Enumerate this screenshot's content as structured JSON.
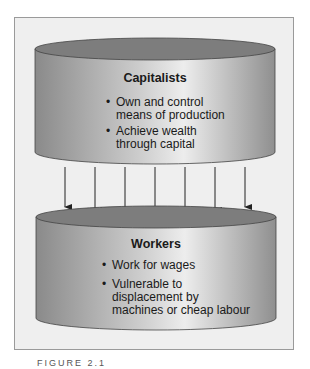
{
  "diagram": {
    "top_cylinder": {
      "title": "Capitalists",
      "bullets": [
        "Own and control means of production",
        "Achieve wealth through capital"
      ],
      "bullet_lines": [
        [
          "Own and control",
          "means of production"
        ],
        [
          "Achieve wealth",
          "through capital"
        ]
      ]
    },
    "bottom_cylinder": {
      "title": "Workers",
      "bullets": [
        "Work for wages",
        "Vulnerable to displacement by machines or cheap labour"
      ],
      "bullet_lines": [
        [
          "Work for wages"
        ],
        [
          "Vulnerable to",
          "displacement by",
          "machines or cheap labour"
        ]
      ]
    },
    "arrows": {
      "count": 7,
      "direction": "down"
    },
    "colors": {
      "panel": "#efefef",
      "cylinder_dark": "#8c8c8c",
      "cylinder_light": "#e6e6e6",
      "top_ellipse": "#7a7a7a"
    }
  },
  "caption": "FIGURE 2.1"
}
